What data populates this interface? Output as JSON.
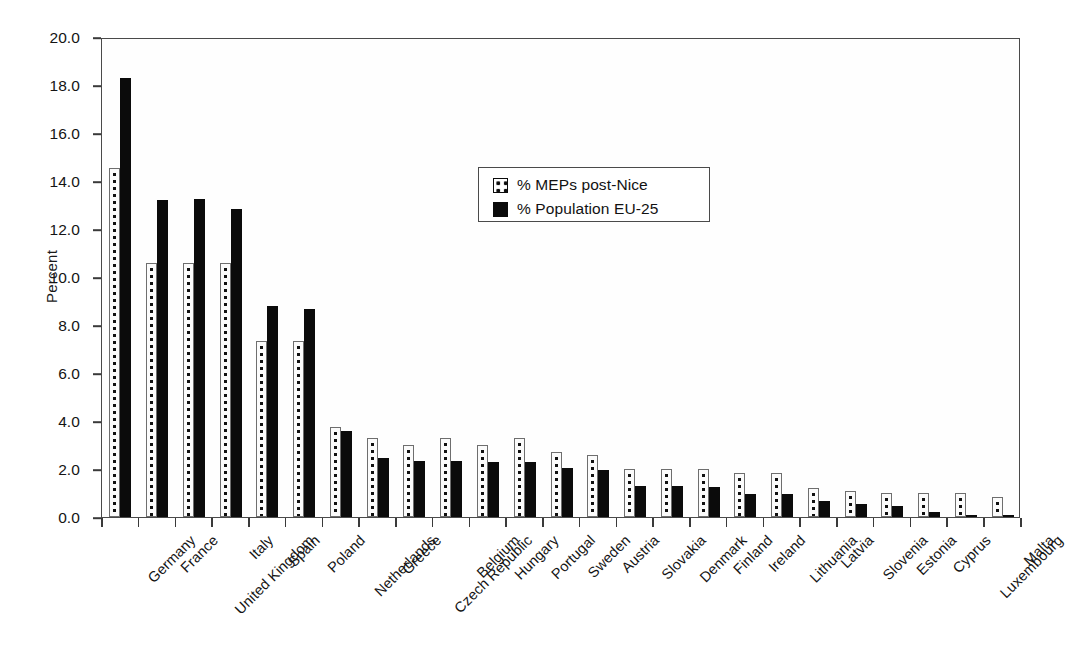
{
  "chart_data": {
    "type": "bar",
    "title": "",
    "xlabel": "",
    "ylabel": "Percent",
    "ylim": [
      0.0,
      20.0
    ],
    "ytick_step": 2.0,
    "ytick_labels": [
      "0.0",
      "2.0",
      "4.0",
      "6.0",
      "8.0",
      "10.0",
      "12.0",
      "14.0",
      "16.0",
      "18.0",
      "20.0"
    ],
    "grid": false,
    "legend_position": "upper-center",
    "categories": [
      "Germany",
      "France",
      "United Kingdom",
      "Italy",
      "Spain",
      "Poland",
      "Netherlands",
      "Greece",
      "Czech Republic",
      "Belgium",
      "Hungary",
      "Portugal",
      "Sweden",
      "Austria",
      "Slovakia",
      "Denmark",
      "Finland",
      "Ireland",
      "Lithuania",
      "Latvia",
      "Slovenia",
      "Estonia",
      "Cyprus",
      "Luxembourg",
      "Malta"
    ],
    "series": [
      {
        "name": "% MEPs post-Nice",
        "style": "dotted-pattern",
        "color": "#fbfbfb",
        "values": [
          14.55,
          10.6,
          10.6,
          10.6,
          7.35,
          7.35,
          3.75,
          3.3,
          3.0,
          3.3,
          3.0,
          3.3,
          2.7,
          2.6,
          2.0,
          2.0,
          2.0,
          1.85,
          1.85,
          1.2,
          1.1,
          1.0,
          1.0,
          1.0,
          0.85
        ]
      },
      {
        "name": "% Population EU-25",
        "style": "solid-black",
        "color": "#0b0b0b",
        "values": [
          18.3,
          13.2,
          13.25,
          12.85,
          8.8,
          8.65,
          3.6,
          2.45,
          2.35,
          2.35,
          2.3,
          2.3,
          2.05,
          1.95,
          1.3,
          1.3,
          1.25,
          0.95,
          0.95,
          0.65,
          0.55,
          0.45,
          0.2,
          0.1,
          0.08
        ]
      }
    ],
    "legend": [
      {
        "label": "% MEPs post-Nice",
        "swatch": "dotted-pattern"
      },
      {
        "label": "% Population EU-25",
        "swatch": "solid-black"
      }
    ]
  }
}
